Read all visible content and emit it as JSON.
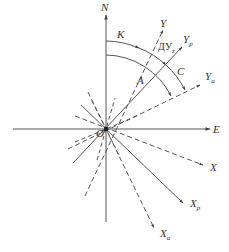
{
  "diagram": {
    "type": "angle-coordinate-diagram",
    "origin": {
      "label": "O",
      "x": 106,
      "y": 129
    },
    "colors": {
      "line": "#444444",
      "text": "#333333",
      "background": "#ffffff"
    },
    "axes": {
      "north": {
        "label": "N"
      },
      "east": {
        "label": "E"
      }
    },
    "rays": [
      {
        "id": "Y",
        "label": "Y",
        "sub": "",
        "style": "dashed"
      },
      {
        "id": "Yp",
        "label": "Y",
        "sub": "p",
        "style": "solid"
      },
      {
        "id": "Ya",
        "label": "Y",
        "sub": "a",
        "style": "dashed"
      },
      {
        "id": "X",
        "label": "X",
        "sub": "",
        "style": "dashed"
      },
      {
        "id": "Xp",
        "label": "X",
        "sub": "p",
        "style": "solid"
      },
      {
        "id": "Xa",
        "label": "X",
        "sub": "a",
        "style": "dashed"
      }
    ],
    "angles": {
      "K": {
        "label": "K",
        "description": "arc from N to Y"
      },
      "A": {
        "label": "A",
        "description": "arc from N to Ya"
      },
      "C": {
        "label": "C",
        "description": "arc from Yp to Ya"
      },
      "DUz": {
        "label": "ДУ",
        "sub": "z",
        "description": "arc from Y to Yp"
      }
    }
  }
}
